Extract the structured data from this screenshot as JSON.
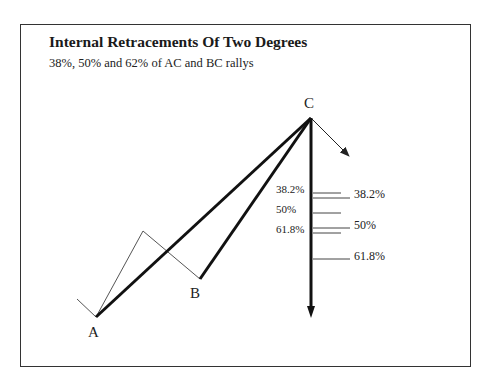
{
  "figure": {
    "title": "Internal Retracements Of Two Degrees",
    "subtitle": "38%, 50% and 62% of AC and BC rallys"
  },
  "points": {
    "A": {
      "label": "A",
      "x": 96,
      "y": 317
    },
    "B": {
      "label": "B",
      "x": 200,
      "y": 279
    },
    "C": {
      "label": "C",
      "x": 311,
      "y": 118
    }
  },
  "retracements": {
    "bc_levels": [
      {
        "label": "38.2%",
        "y": 193
      },
      {
        "label": "50%",
        "y": 213
      },
      {
        "label": "61.8%",
        "y": 233
      }
    ],
    "ac_levels": [
      {
        "label": "38.2%",
        "y": 198
      },
      {
        "label": "50%",
        "y": 228
      },
      {
        "label": "61.8%",
        "y": 259
      }
    ]
  },
  "colors": {
    "line": "#111111",
    "thin_line": "#555555",
    "frame": "#333333"
  }
}
